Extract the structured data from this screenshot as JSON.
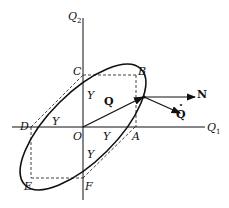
{
  "diagram": {
    "axes": {
      "horizontal_label": "Q",
      "horizontal_sub": "1",
      "vertical_label": "Q",
      "vertical_sub": "2",
      "origin_label": "O"
    },
    "points": {
      "A": "A",
      "B": "B",
      "C": "C",
      "D": "D",
      "E": "E",
      "F": "F"
    },
    "segment_labels": {
      "y_on_vertical_upper": "Y",
      "y_on_horizontal_left": "Y",
      "y_on_horizontal_right": "Y",
      "y_on_vertical_lower": "Y"
    },
    "vectors": {
      "position": "Q",
      "normal": "N",
      "rate": "Q",
      "rate_dot": "·"
    },
    "colors": {
      "ink": "#111111",
      "background": "#ffffff"
    }
  }
}
